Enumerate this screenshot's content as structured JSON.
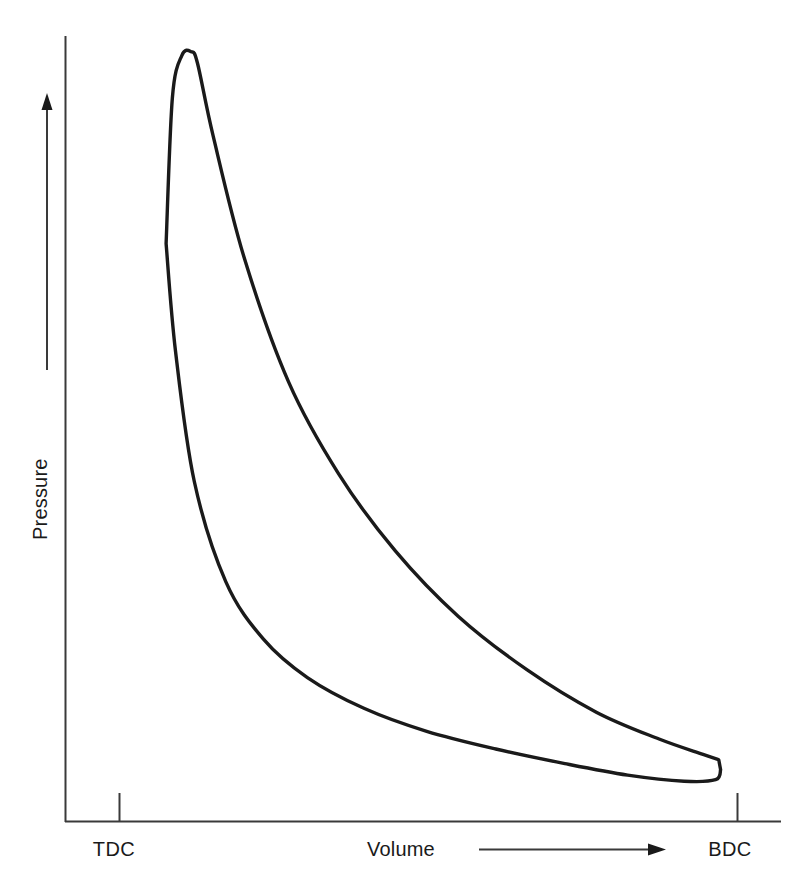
{
  "figure": {
    "background_color": "#ffffff",
    "line_color": "#1a1a1a",
    "axis_color": "#3a3a3a",
    "text_color": "#1a1a1a"
  },
  "axes": {
    "y_label": "Pressure",
    "x_label": "Volume",
    "x_ticks": [
      {
        "label": "TDC",
        "name": "tick-tdc"
      },
      {
        "label": "BDC",
        "name": "tick-bdc"
      }
    ]
  },
  "caption": {
    "text": ""
  },
  "chart_data": {
    "type": "line",
    "title": "",
    "subtitle": "",
    "xlabel": "Volume",
    "ylabel": "Pressure",
    "xlim": [
      0,
      1
    ],
    "ylim": [
      0,
      1
    ],
    "grid": false,
    "legend": null,
    "annotations": [
      {
        "text": "TDC",
        "position": "x-axis-left-tick",
        "meaning": "Top Dead Center"
      },
      {
        "text": "BDC",
        "position": "x-axis-right-tick",
        "meaning": "Bottom Dead Center"
      },
      {
        "text": "Volume",
        "position": "x-axis-label-with-right-arrow"
      },
      {
        "text": "Pressure",
        "position": "y-axis-label-with-up-arrow"
      }
    ],
    "series": [
      {
        "name": "Expansion branch (upper)",
        "x": [
          0.075,
          0.085,
          0.1,
          0.115,
          0.125,
          0.15,
          0.2,
          0.27,
          0.35,
          0.44,
          0.54,
          0.65,
          0.76,
          0.86,
          0.93,
          0.955
        ],
        "y": [
          0.74,
          0.93,
          0.985,
          0.99,
          0.975,
          0.88,
          0.72,
          0.56,
          0.44,
          0.34,
          0.255,
          0.185,
          0.13,
          0.095,
          0.075,
          0.068
        ]
      },
      {
        "name": "Compression branch (lower)",
        "x": [
          0.075,
          0.09,
          0.12,
          0.17,
          0.23,
          0.3,
          0.39,
          0.49,
          0.6,
          0.71,
          0.81,
          0.9,
          0.95,
          0.958
        ],
        "y": [
          0.74,
          0.6,
          0.43,
          0.3,
          0.225,
          0.175,
          0.135,
          0.105,
          0.082,
          0.063,
          0.048,
          0.04,
          0.042,
          0.055
        ]
      }
    ]
  }
}
